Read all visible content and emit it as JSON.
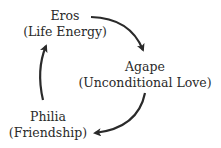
{
  "diagram": {
    "type": "cycle",
    "nodes": [
      {
        "id": "eros",
        "title": "Eros",
        "subtitle": "(Life Energy)"
      },
      {
        "id": "agape",
        "title": "Agape",
        "subtitle": "(Unconditional Love)"
      },
      {
        "id": "philia",
        "title": "Philia",
        "subtitle": "(Friendship)"
      }
    ],
    "edges": [
      {
        "from": "eros",
        "to": "agape"
      },
      {
        "from": "agape",
        "to": "philia"
      },
      {
        "from": "philia",
        "to": "eros"
      }
    ],
    "colors": {
      "stroke": "#2a2a2a",
      "text": "#2a2a2a",
      "background": "#ffffff"
    }
  }
}
